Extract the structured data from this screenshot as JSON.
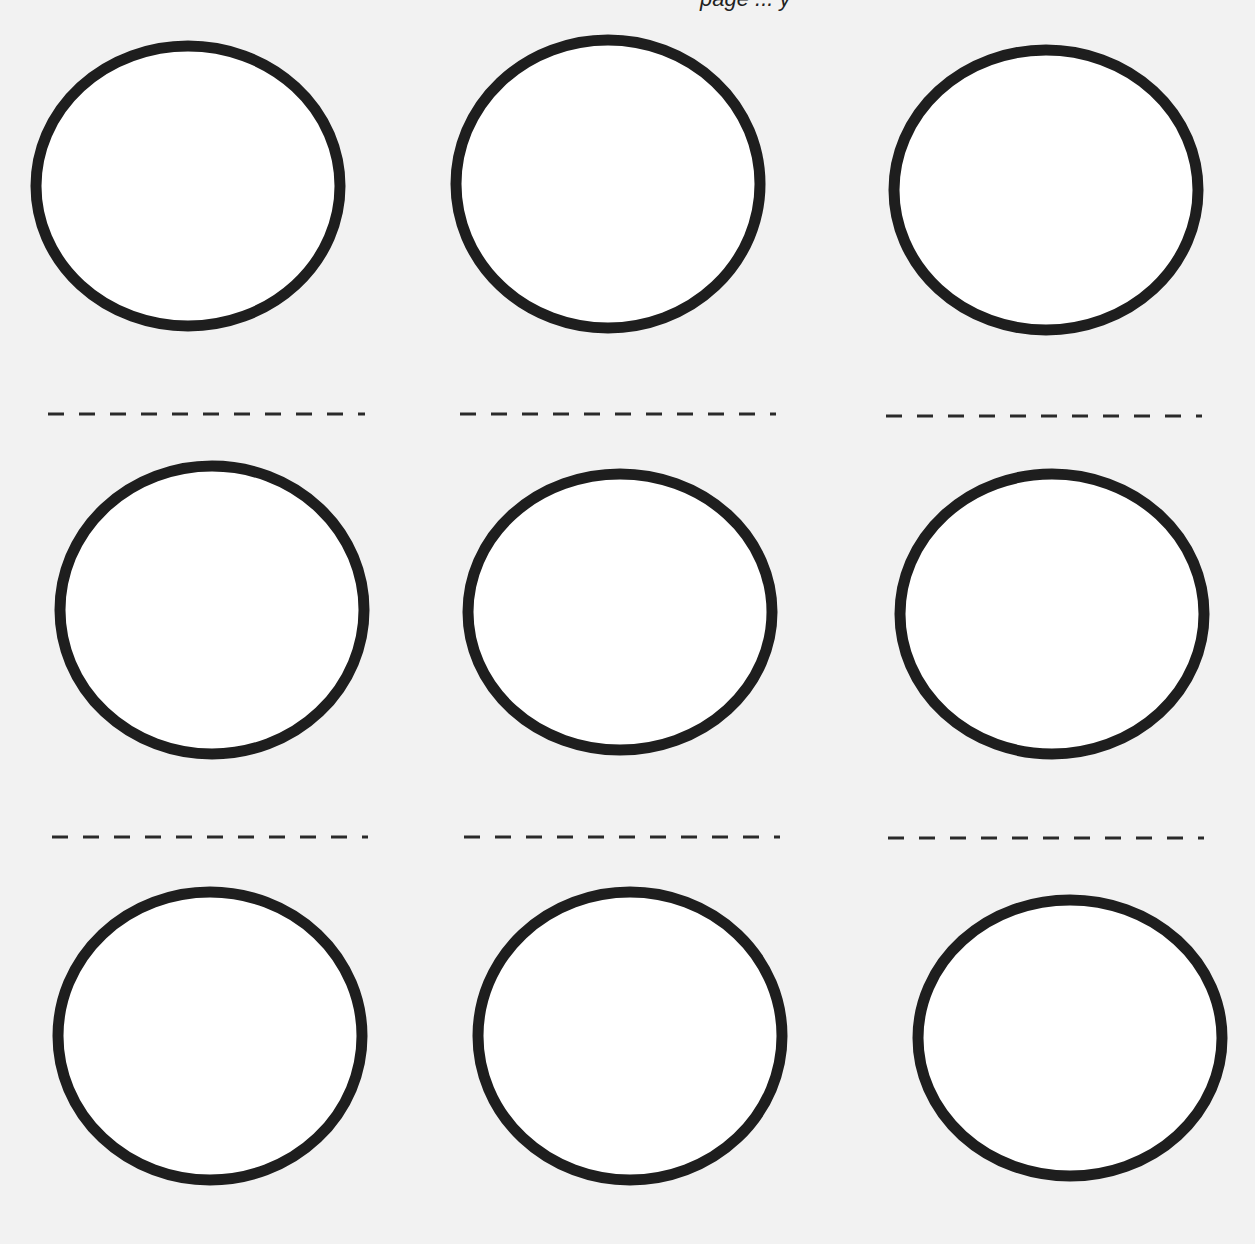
{
  "page": {
    "top_text_clipped": "page ... y",
    "background": "#f2f2f2",
    "ink": "#1e1e1e"
  },
  "grid": {
    "rows": 3,
    "cols": 3,
    "circles": [
      {
        "id": "c1",
        "cx": 188,
        "cy": 186,
        "rx": 152,
        "ry": 140
      },
      {
        "id": "c2",
        "cx": 608,
        "cy": 184,
        "rx": 152,
        "ry": 144
      },
      {
        "id": "c3",
        "cx": 1046,
        "cy": 190,
        "rx": 152,
        "ry": 140
      },
      {
        "id": "c4",
        "cx": 212,
        "cy": 610,
        "rx": 152,
        "ry": 144
      },
      {
        "id": "c5",
        "cx": 620,
        "cy": 612,
        "rx": 152,
        "ry": 138
      },
      {
        "id": "c6",
        "cx": 1052,
        "cy": 614,
        "rx": 152,
        "ry": 140
      },
      {
        "id": "c7",
        "cx": 210,
        "cy": 1036,
        "rx": 152,
        "ry": 144
      },
      {
        "id": "c8",
        "cx": 630,
        "cy": 1036,
        "rx": 152,
        "ry": 144
      },
      {
        "id": "c9",
        "cx": 1070,
        "cy": 1038,
        "rx": 152,
        "ry": 138
      }
    ],
    "dashed_lines": [
      {
        "id": "d1",
        "x1": 48,
        "x2": 365,
        "y": 414
      },
      {
        "id": "d2",
        "x1": 460,
        "x2": 776,
        "y": 414
      },
      {
        "id": "d3",
        "x1": 886,
        "x2": 1202,
        "y": 416
      },
      {
        "id": "d4",
        "x1": 52,
        "x2": 368,
        "y": 837
      },
      {
        "id": "d5",
        "x1": 464,
        "x2": 780,
        "y": 837
      },
      {
        "id": "d6",
        "x1": 888,
        "x2": 1204,
        "y": 838
      }
    ]
  }
}
